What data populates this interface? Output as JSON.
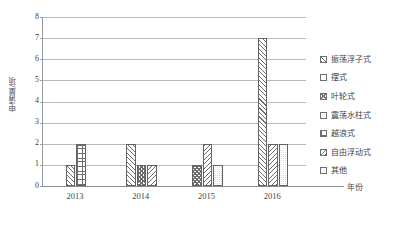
{
  "chart_data": {
    "type": "bar",
    "title": "",
    "subtitle": "",
    "xlabel": "年份",
    "ylabel": "申请量/项",
    "categories": [
      "2013",
      "2014",
      "2015",
      "2016"
    ],
    "ylim": [
      0,
      8
    ],
    "y_ticks": [
      "0",
      "1",
      "2",
      "3",
      "4",
      "5",
      "6",
      "7",
      "8"
    ],
    "grid": true,
    "legend_position": "right",
    "series": [
      {
        "name": "振荡浮子式",
        "pattern": "diagonal-hatch",
        "values": [
          1,
          2,
          0,
          7
        ]
      },
      {
        "name": "摆式",
        "pattern": "light-open",
        "values": [
          0,
          0,
          0,
          0
        ]
      },
      {
        "name": "叶轮式",
        "pattern": "crosshatch-check",
        "values": [
          0,
          1,
          1,
          0
        ]
      },
      {
        "name": "震荡水柱式",
        "pattern": "fine-dot",
        "values": [
          0,
          0,
          0,
          0
        ]
      },
      {
        "name": "越浪式",
        "pattern": "grid",
        "values": [
          2,
          0,
          0,
          0
        ]
      },
      {
        "name": "自由浮动式",
        "pattern": "back-diagonal-hatch",
        "values": [
          0,
          1,
          2,
          2
        ]
      },
      {
        "name": "其他",
        "pattern": "open",
        "values": [
          0,
          0,
          1,
          2
        ]
      }
    ],
    "annotations": []
  },
  "legend": {
    "items": [
      {
        "label": "振荡浮子式",
        "swatch": "diagonal-hatch-swatch"
      },
      {
        "label": "摆式",
        "swatch": "light-open-swatch"
      },
      {
        "label": "叶轮式",
        "swatch": "crosshatch-check-swatch"
      },
      {
        "label": "震荡水柱式",
        "swatch": "fine-dot-swatch"
      },
      {
        "label": "越浪式",
        "swatch": "grid-swatch"
      },
      {
        "label": "自由浮动式",
        "swatch": "back-diagonal-hatch-swatch"
      },
      {
        "label": "其他",
        "swatch": "open-swatch"
      }
    ]
  },
  "axes": {
    "y_title": "申请量/项",
    "x_title": "年份"
  },
  "colors": {
    "gridline": "#b9b9b9",
    "axis": "#8d8d8d",
    "bar_outline": "#636363",
    "pattern": "#6e6e6e",
    "text": "#3f3f3f",
    "background": "#ffffff"
  }
}
